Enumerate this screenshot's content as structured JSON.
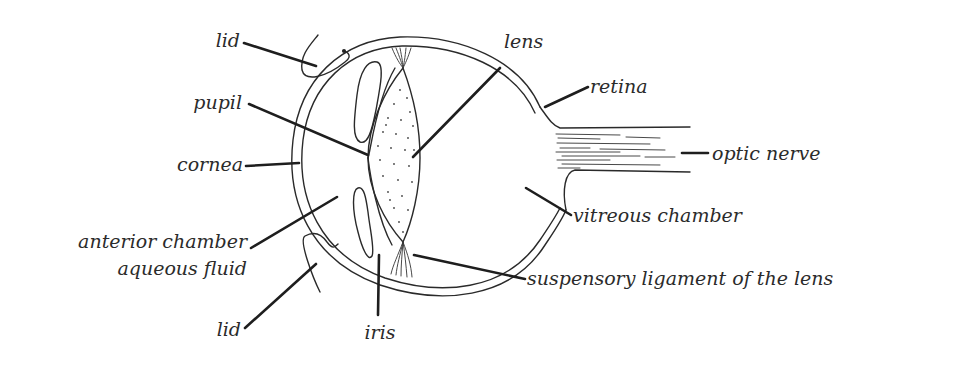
{
  "diagram": {
    "labels": {
      "lid_top": "lid",
      "pupil": "pupil",
      "cornea": "cornea",
      "anterior_chamber": "anterior chamber",
      "aqueous_fluid": "aqueous fluid",
      "lid_bottom": "lid",
      "iris": "iris",
      "lens": "lens",
      "retina": "retina",
      "optic_nerve": "optic nerve",
      "vitreous_chamber": "vitreous chamber",
      "suspensory_ligament": "suspensory ligament of the lens"
    },
    "colors": {
      "background": "#ffffff",
      "ink": "#2a2a2a",
      "text": "#2b2b2b"
    }
  }
}
